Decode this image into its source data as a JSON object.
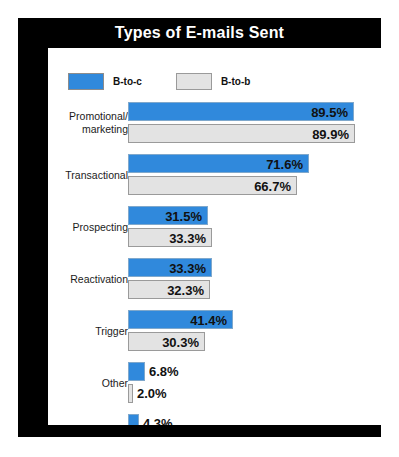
{
  "chart_title": "Types of E-mails Sent",
  "legend": {
    "entries": [
      {
        "label": "B-to-c",
        "color": "#3089dc"
      },
      {
        "label": "B-to-b",
        "color": "#e3e3e3"
      }
    ]
  },
  "colors": {
    "series_c": "#3089dc",
    "series_b": "#e3e3e3",
    "frame": "#000000",
    "plot_background": "#ffffff",
    "title_text": "#ffffff"
  },
  "chart_data": {
    "type": "bar",
    "orientation": "horizontal",
    "title": "Types of E-mails Sent",
    "xlabel": "",
    "ylabel": "",
    "xlim": [
      0,
      100
    ],
    "grid": false,
    "legend_position": "top-left",
    "value_suffix": "%",
    "categories": [
      "Promotional/ marketing",
      "Transactional",
      "Prospecting",
      "Reactivation",
      "Trigger",
      "Other",
      "None"
    ],
    "series": [
      {
        "name": "B-to-c",
        "color": "#3089dc",
        "values": [
          89.5,
          71.6,
          31.5,
          33.3,
          41.4,
          6.8,
          4.3
        ]
      },
      {
        "name": "B-to-b",
        "color": "#e3e3e3",
        "values": [
          89.9,
          66.7,
          33.3,
          32.3,
          30.3,
          2.0,
          5.1
        ]
      }
    ]
  },
  "groups": [
    {
      "label_line1": "Promotional/",
      "label_line2": "marketing",
      "c": {
        "value": 89.5,
        "text": "89.5%",
        "inside": true
      },
      "b": {
        "value": 89.9,
        "text": "89.9%",
        "inside": true
      }
    },
    {
      "label_line1": "Transactional",
      "label_line2": "",
      "c": {
        "value": 71.6,
        "text": "71.6%",
        "inside": true
      },
      "b": {
        "value": 66.7,
        "text": "66.7%",
        "inside": true
      }
    },
    {
      "label_line1": "Prospecting",
      "label_line2": "",
      "c": {
        "value": 31.5,
        "text": "31.5%",
        "inside": true
      },
      "b": {
        "value": 33.3,
        "text": "33.3%",
        "inside": true
      }
    },
    {
      "label_line1": "Reactivation",
      "label_line2": "",
      "c": {
        "value": 33.3,
        "text": "33.3%",
        "inside": true
      },
      "b": {
        "value": 32.3,
        "text": "32.3%",
        "inside": true
      }
    },
    {
      "label_line1": "Trigger",
      "label_line2": "",
      "c": {
        "value": 41.4,
        "text": "41.4%",
        "inside": true
      },
      "b": {
        "value": 30.3,
        "text": "30.3%",
        "inside": true
      }
    },
    {
      "label_line1": "Other",
      "label_line2": "",
      "c": {
        "value": 6.8,
        "text": "6.8%",
        "inside": false
      },
      "b": {
        "value": 2.0,
        "text": "2.0%",
        "inside": false
      }
    },
    {
      "label_line1": "None",
      "label_line2": "",
      "c": {
        "value": 4.3,
        "text": "4.3%",
        "inside": false
      },
      "b": {
        "value": 5.1,
        "text": "5.1%",
        "inside": false
      }
    }
  ]
}
